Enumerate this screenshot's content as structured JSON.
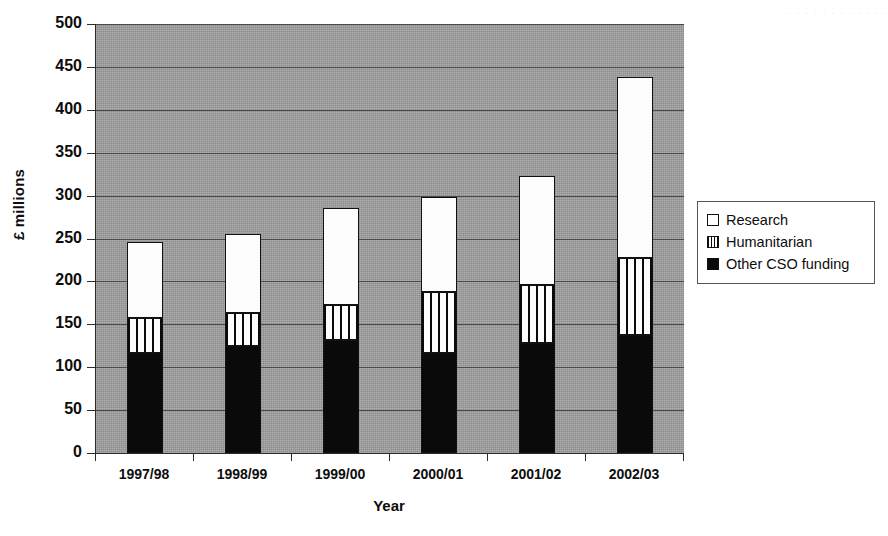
{
  "chart_data": {
    "type": "bar",
    "stacked": true,
    "title": "",
    "xlabel": "Year",
    "ylabel": "£ millions",
    "ylim": [
      0,
      500
    ],
    "ytick_step": 50,
    "yticks": [
      0,
      50,
      100,
      150,
      200,
      250,
      300,
      350,
      400,
      450,
      500
    ],
    "grid": "horizontal",
    "legend_position": "right",
    "plot_background": "#9e9e9e",
    "categories": [
      "1997/98",
      "1998/99",
      "1999/00",
      "2000/01",
      "2001/02",
      "2002/03"
    ],
    "series": [
      {
        "name": "Other CSO funding",
        "fill": "solid-black",
        "color": "#0a0a0a",
        "values": [
          116,
          125,
          132,
          116,
          128,
          138
        ]
      },
      {
        "name": "Humanitarian",
        "fill": "vertical-stripes",
        "color": "#ffffff",
        "values": [
          41,
          38,
          40,
          72,
          68,
          89
        ]
      },
      {
        "name": "Research",
        "fill": "solid-white",
        "color": "#ffffff",
        "values": [
          89,
          92,
          113,
          110,
          127,
          211
        ]
      }
    ],
    "totals": [
      246,
      255,
      285,
      298,
      323,
      438
    ]
  },
  "legend": {
    "items": [
      {
        "label": "Research",
        "swatch": "white-square-icon"
      },
      {
        "label": "Humanitarian",
        "swatch": "striped-square-icon"
      },
      {
        "label": "Other CSO funding",
        "swatch": "black-square-icon"
      }
    ]
  },
  "bleed_artifact": "· · · · · · · · · · · ·"
}
